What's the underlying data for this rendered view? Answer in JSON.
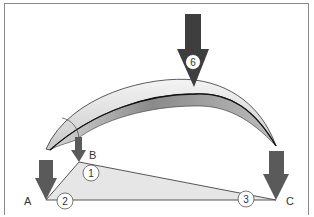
{
  "diagram": {
    "points": {
      "A": {
        "label": "A"
      },
      "B": {
        "label": "B"
      },
      "C": {
        "label": "C"
      }
    },
    "markers": [
      {
        "id": "1",
        "label": "1"
      },
      {
        "id": "2",
        "label": "2"
      },
      {
        "id": "3",
        "label": "3"
      },
      {
        "id": "6",
        "label": "6"
      }
    ],
    "colors": {
      "arrow": "#5a5a5a",
      "arrow_dark": "#3a3a3a",
      "triangle_fill": "#e6e6e6",
      "arch_light": "#e8e8e8",
      "arch_dark": "#8c8c8c",
      "frame": "#8a8a8a"
    }
  }
}
